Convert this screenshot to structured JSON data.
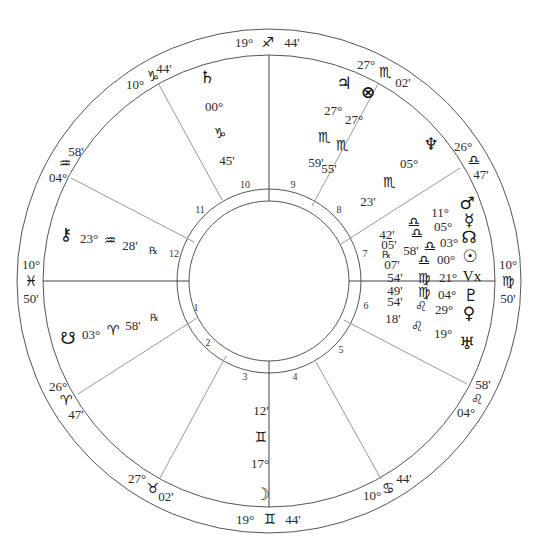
{
  "chart": {
    "type": "natal-wheel",
    "center": [
      269,
      281
    ],
    "radii": {
      "outer": 252,
      "cusp_ring": 226,
      "house_ring_outer": 92,
      "house_ring_inner": 80
    },
    "colors": {
      "ring": "#555555",
      "cusp_line": "#999999",
      "axis_line": "#444444",
      "text": "#222222"
    }
  },
  "cusps": [
    {
      "id": "mc",
      "deg": "19°",
      "sign": "♐",
      "sign_name": "sagittarius",
      "min": "44'"
    },
    {
      "id": "c11",
      "deg": "10°",
      "sign": "♑",
      "sign_name": "capricorn",
      "min": "44'"
    },
    {
      "id": "c12",
      "deg": "04°",
      "sign": "♒",
      "sign_name": "aquarius",
      "min": "58'"
    },
    {
      "id": "asc",
      "deg": "10°",
      "sign": "♓",
      "sign_name": "pisces",
      "min": "50'"
    },
    {
      "id": "c2",
      "deg": "26°",
      "sign": "♈",
      "sign_name": "aries",
      "min": "47'"
    },
    {
      "id": "c3",
      "deg": "27°",
      "sign": "♉",
      "sign_name": "taurus",
      "min": "02'"
    },
    {
      "id": "ic",
      "deg": "19°",
      "sign": "♊",
      "sign_name": "gemini",
      "min": "44'"
    },
    {
      "id": "c5",
      "deg": "10°",
      "sign": "♋",
      "sign_name": "cancer",
      "min": "44'"
    },
    {
      "id": "c6",
      "deg": "04°",
      "sign": "♌",
      "sign_name": "leo",
      "min": "58'"
    },
    {
      "id": "dsc",
      "deg": "10°",
      "sign": "♍",
      "sign_name": "virgo",
      "min": "50'"
    },
    {
      "id": "c8",
      "deg": "26°",
      "sign": "♎",
      "sign_name": "libra",
      "min": "47'"
    },
    {
      "id": "c9",
      "deg": "27°",
      "sign": "♏",
      "sign_name": "scorpio",
      "min": "02'"
    }
  ],
  "houses": [
    "1",
    "2",
    "3",
    "4",
    "5",
    "6",
    "7",
    "8",
    "9",
    "10",
    "11",
    "12"
  ],
  "planets": [
    {
      "name": "saturn",
      "glyph": "♄",
      "deg": "00°",
      "sign": "♑",
      "min": "45'"
    },
    {
      "name": "jupiter",
      "glyph": "♃",
      "deg": "27°",
      "sign": "♏",
      "min": "59'"
    },
    {
      "name": "part-of-fortune",
      "glyph": "⊗",
      "deg": "27°",
      "sign": "♏",
      "min": "55'"
    },
    {
      "name": "neptune",
      "glyph": "♆",
      "deg": "05°",
      "sign": "♏",
      "min": "23'"
    },
    {
      "name": "mars",
      "glyph": "♂",
      "deg": "11°",
      "sign": "♎",
      "min": "42'"
    },
    {
      "name": "mercury",
      "glyph": "☿",
      "deg": "05°",
      "sign": "♎",
      "min": "05'",
      "retro": "℞"
    },
    {
      "name": "north-node",
      "glyph": "☊",
      "deg": "03°",
      "sign": "♎",
      "min": "58'"
    },
    {
      "name": "sun",
      "glyph": "☉",
      "deg": "00°",
      "sign": "♎",
      "min": "07'"
    },
    {
      "name": "vertex",
      "glyph": "Vx",
      "deg": "21°",
      "sign": "♍",
      "min": "54'"
    },
    {
      "name": "pluto",
      "glyph": "♇",
      "deg": "04°",
      "sign": "♍",
      "min": "49'"
    },
    {
      "name": "venus",
      "glyph": "♀",
      "deg": "29°",
      "sign": "♌",
      "min": "54'"
    },
    {
      "name": "uranus",
      "glyph": "♅",
      "deg": "19°",
      "sign": "♌",
      "min": "18'"
    },
    {
      "name": "moon",
      "glyph": "☽",
      "deg": "17°",
      "sign": "♊",
      "min": "12'"
    },
    {
      "name": "chiron",
      "glyph": "⚷",
      "deg": "23°",
      "sign": "♒",
      "min": "28'",
      "retro": "℞"
    },
    {
      "name": "south-node",
      "glyph": "☋",
      "deg": "03°",
      "sign": "♈",
      "min": "58'",
      "retro": "℞"
    }
  ]
}
